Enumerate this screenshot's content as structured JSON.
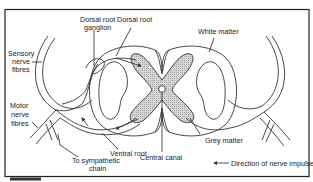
{
  "diagram": {
    "labels": {
      "dorsal_root_ganglion": [
        "Dorsal root",
        "ganglion"
      ],
      "dorsal_root": "Dorsal root",
      "white_matter": "White matter",
      "sensory_nerve_fibres": [
        "Sensory",
        "nerve",
        "fibres"
      ],
      "motor_nerve_fibres": [
        "Motor",
        "nerve",
        "fibres"
      ],
      "ventral_root": "Ventral root",
      "to_sympathetic_chain": [
        "To sympathetic",
        "chain"
      ],
      "central_canal": "Central canal",
      "grey_matter": "Grey matter"
    },
    "legend": {
      "arrow_label": "Direction of nerve impulses"
    },
    "colors": {
      "line": "#333333",
      "grey_matter_fill": "#c8c8c8",
      "frame": "#222222",
      "background": "#ffffff"
    }
  }
}
